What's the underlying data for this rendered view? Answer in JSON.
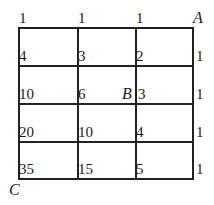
{
  "figure": {
    "type": "lattice-path-grid",
    "labels": {
      "A": "A",
      "B": "B",
      "C": "C"
    },
    "top_row": [
      "1",
      "1",
      "1"
    ],
    "rows": [
      {
        "values": [
          "4",
          "3",
          "2"
        ],
        "right": "1"
      },
      {
        "values": [
          "10",
          "6",
          "3"
        ],
        "right": "1"
      },
      {
        "values": [
          "20",
          "10",
          "4"
        ],
        "right": "1"
      },
      {
        "values": [
          "35",
          "15",
          "5"
        ],
        "right": "1"
      }
    ]
  }
}
